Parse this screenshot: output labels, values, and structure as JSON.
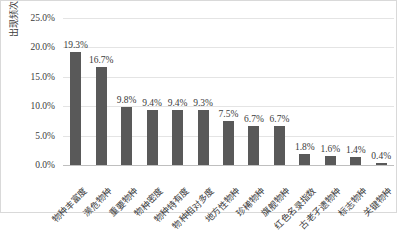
{
  "chart_data": {
    "type": "bar",
    "title": "",
    "xlabel": "",
    "ylabel": "出现频次",
    "ylim": [
      0,
      25
    ],
    "ytick_labels": [
      "0.0%",
      "5.0%",
      "10.0%",
      "15.0%",
      "20.0%",
      "25.0%"
    ],
    "ytick_values": [
      0,
      5,
      10,
      15,
      20,
      25
    ],
    "grid": true,
    "legend": "none",
    "bar_color": "#595959",
    "categories": [
      "物种丰富度",
      "濒危物种",
      "重要物种",
      "物种密度",
      "物种特有度",
      "物种相对多度",
      "地方性物种",
      "珍稀物种",
      "旗舰物种",
      "红色名录指数",
      "古老孑遗物种",
      "标志物种",
      "关键物种"
    ],
    "values": [
      19.3,
      16.7,
      9.8,
      9.4,
      9.4,
      9.3,
      7.5,
      6.7,
      6.7,
      1.8,
      1.6,
      1.4,
      0.4
    ],
    "data_labels": [
      "19.3%",
      "16.7%",
      "9.8%",
      "9.4%",
      "9.4%",
      "9.3%",
      "7.5%",
      "6.7%",
      "6.7%",
      "1.8%",
      "1.6%",
      "1.4%",
      "0.4%"
    ]
  },
  "caption": ""
}
